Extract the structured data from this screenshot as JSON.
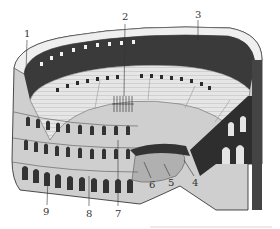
{
  "diagram": {
    "labels": [
      {
        "id": "1",
        "text": "1",
        "x": 24,
        "y": 29
      },
      {
        "id": "2",
        "text": "2",
        "x": 122,
        "y": 12
      },
      {
        "id": "3",
        "text": "3",
        "x": 195,
        "y": 10
      },
      {
        "id": "4",
        "text": "4",
        "x": 192,
        "y": 178
      },
      {
        "id": "5",
        "text": "5",
        "x": 168,
        "y": 178
      },
      {
        "id": "6",
        "text": "6",
        "x": 149,
        "y": 180
      },
      {
        "id": "7",
        "text": "7",
        "x": 115,
        "y": 209
      },
      {
        "id": "8",
        "text": "8",
        "x": 86,
        "y": 209
      },
      {
        "id": "9",
        "text": "9",
        "x": 43,
        "y": 207
      }
    ],
    "colors": {
      "ink": "#1a1a1a",
      "stone_light": "#e8e8e8",
      "stone_mid": "#a8a8a8",
      "shadow": "#2a2a2a",
      "arena_floor": "#b0b0b0"
    }
  }
}
